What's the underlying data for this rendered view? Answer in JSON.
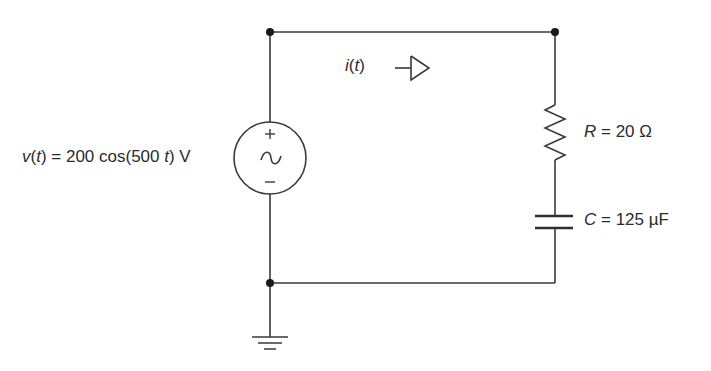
{
  "circuit": {
    "source": {
      "type": "ac-voltage-source",
      "label_prefix_var": "v",
      "label_prefix_arg": "t",
      "label_eq": " = 200 cos(500 ",
      "label_t": "t",
      "label_suffix": ") V",
      "polarity_plus": "+",
      "polarity_minus": "−",
      "symbol": "∼"
    },
    "current": {
      "var": "i",
      "arg": "t",
      "direction": "right"
    },
    "resistor": {
      "symbol": "R",
      "value_text": " = 20 Ω"
    },
    "capacitor": {
      "symbol": "C",
      "value_text": " = 125 µF"
    },
    "ground": true,
    "colors": {
      "wire": "#3a3a3a",
      "text": "#2b2b2b",
      "background": "#ffffff"
    }
  }
}
